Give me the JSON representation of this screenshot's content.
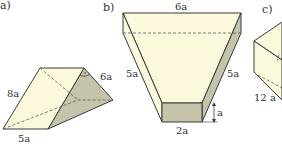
{
  "figures": [
    {
      "id": "a",
      "label": "a)",
      "shape": "triangular prism",
      "dimensions": {
        "slant_edge": "8a",
        "base_edge": "5a",
        "triangle_side": "6a"
      },
      "right_angle_marked": true
    },
    {
      "id": "b",
      "label": "b)",
      "shape": "trapezoidal prism",
      "dimensions": {
        "top_edge": "6a",
        "left_leg": "5a",
        "right_leg": "5a",
        "bottom_edge": "2a",
        "height": "a"
      }
    },
    {
      "id": "c",
      "label": "c)",
      "shape": "prism (partially visible)",
      "dimensions": {
        "edge": "12 a"
      }
    }
  ],
  "colors": {
    "face_light": "#fbf8dc",
    "face_shaded": "#c5c4ab",
    "edge": "#3a3a3a",
    "dashed": "#5a5a5a",
    "text": "#333333"
  }
}
